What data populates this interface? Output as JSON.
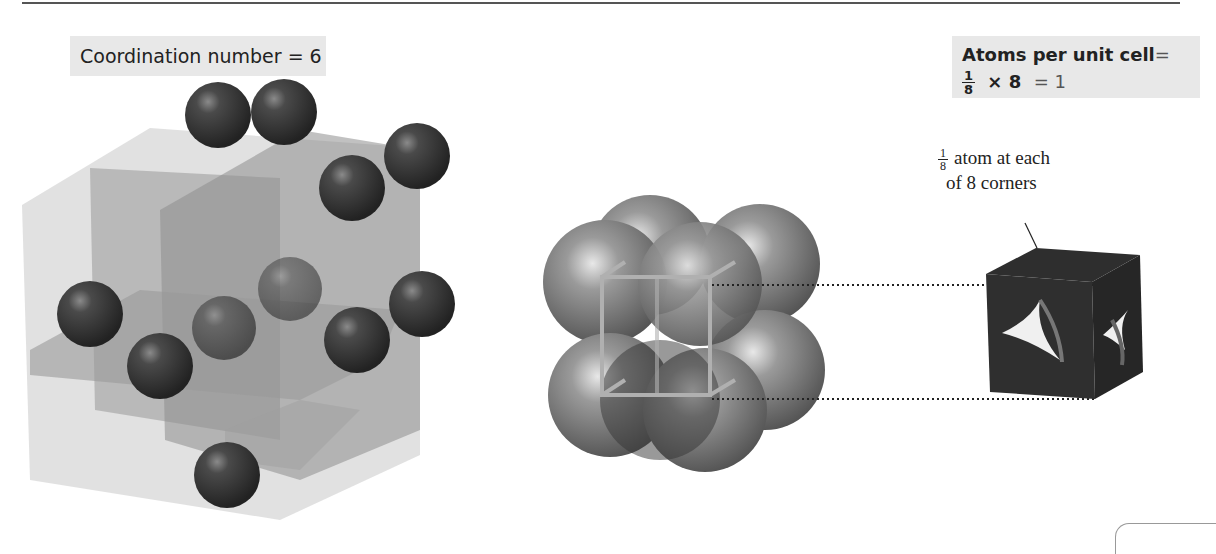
{
  "figure": {
    "panel_left": {
      "label": "Coordination number = 6",
      "description": "Simple cubic lattice showing six nearest neighbors along three intersecting planes"
    },
    "panel_middle": {
      "description": "Eight corner spheres packed around a simple cubic unit cell frame"
    },
    "panel_right": {
      "title": "Atoms per unit cell",
      "title_eq": "=",
      "formula": {
        "fraction_num": "1",
        "fraction_den": "8",
        "times": "× 8",
        "result": "= 1"
      },
      "callout": {
        "fraction_num": "1",
        "fraction_den": "8",
        "line1": "atom at each",
        "line2": "of 8 corners"
      }
    }
  },
  "colors": {
    "label_bg": "#e8e8e8",
    "sphere_dark": "#3a3a3a",
    "plane_gray": "#8a8a8a",
    "cube_light": "#d6d6d6"
  }
}
